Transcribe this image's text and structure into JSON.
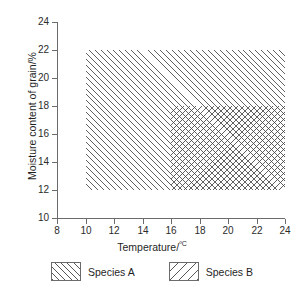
{
  "chart_data": {
    "type": "area",
    "title": "",
    "xlabel": "Temperature/ºC",
    "ylabel": "Moisture content of grain/%",
    "xlim": [
      8,
      24
    ],
    "ylim": [
      10,
      24
    ],
    "xticks": [
      8,
      10,
      12,
      14,
      16,
      18,
      20,
      22,
      24
    ],
    "yticks": [
      10,
      12,
      14,
      16,
      18,
      20,
      22,
      24
    ],
    "grid": false,
    "legend_position": "bottom",
    "series": [
      {
        "name": "Species A",
        "hatch": "/",
        "x_range": [
          10,
          24
        ],
        "y_range": [
          12,
          22
        ]
      },
      {
        "name": "Species B",
        "hatch": "\\",
        "x_range": [
          16,
          24
        ],
        "y_range": [
          12,
          18
        ]
      }
    ]
  },
  "axes": {
    "x_title": "Temperature/",
    "x_title_unit": "ºC",
    "y_title": "Moisture content of grain/%",
    "x_tick_labels": [
      "8",
      "10",
      "12",
      "14",
      "16",
      "18",
      "20",
      "22",
      "24"
    ],
    "y_tick_labels": [
      "10",
      "12",
      "14",
      "16",
      "18",
      "20",
      "22",
      "24"
    ]
  },
  "legend": {
    "entries": [
      {
        "label": "Species A"
      },
      {
        "label": "Species B"
      }
    ]
  }
}
